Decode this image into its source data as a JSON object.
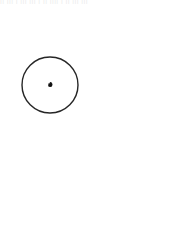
{
  "figure": {
    "type": "geometric-diagram",
    "width": 175,
    "height": 244,
    "background_color": "#ffffff"
  },
  "top_text_artifact": {
    "visible": true,
    "text": "|| ||| |  ||| ||| | || |||| |  || ||| |||",
    "color": "#d8d8d8",
    "note": "clipped partial line of text at top edge"
  },
  "chart_data": {
    "type": "line",
    "subtitle": "",
    "xlabel": "",
    "ylabel": "",
    "grid": false,
    "legend": null,
    "xlim": [
      0,
      175
    ],
    "ylim": [
      0,
      244
    ],
    "pole": {
      "x": 50,
      "y": 85,
      "label": "pole"
    },
    "spiral": {
      "equation": "r = a * exp(b * theta)",
      "growth_ratio_per_quarter_turn": 1.618,
      "a": 0.55,
      "theta_start_deg": -1440,
      "theta_end_deg": 255,
      "direction": "counterclockwise-outward",
      "start_angle_offset_deg": 180,
      "stroke_color": "#1a1a1a",
      "stroke_width": 1.9,
      "outer_end_point": {
        "x": 26,
        "y": 228
      },
      "rightmost_point": {
        "x": 168,
        "y": 105
      },
      "topmost_point": {
        "x": 76,
        "y": 13
      }
    },
    "inner_circle": {
      "cx": 50,
      "cy": 85,
      "r": 28,
      "stroke_color": "#262626",
      "stroke_width": 1.4,
      "fill": "none"
    },
    "radial_spokes": {
      "count": 28,
      "angle_step_deg": 45,
      "stroke_color": "#6e6e6e",
      "stroke_width": 0.7,
      "description": "rays from pole to successive spiral vertices"
    },
    "chord_lines": {
      "count": 28,
      "stroke_color": "#6e6e6e",
      "stroke_width": 0.7,
      "description": "chords joining successive quarter-turn spiral vertices"
    },
    "pole_marker": {
      "shape": "square",
      "size": 3.2,
      "color": "#111111"
    }
  }
}
